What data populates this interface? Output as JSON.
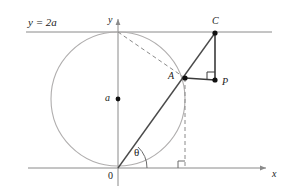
{
  "figure": {
    "width": 288,
    "height": 194,
    "background": "#ffffff"
  },
  "colors": {
    "axis": "#8a8a8a",
    "tangent_line": "#8a8a8a",
    "circle": "#b0aeae",
    "solid_ray": "#4a4a4a",
    "segment": "#3a3a3a",
    "dashed": "#8a8a8a",
    "point_fill": "#111111",
    "label_text": "#1b1b1b"
  },
  "labels": {
    "line_equation": "y = 2a",
    "y_axis": "y",
    "x_axis": "x",
    "origin": "0",
    "center": "a",
    "point_a": "A",
    "point_c": "C",
    "point_p": "P",
    "angle_theta": "θ"
  },
  "geometry": {
    "origin": {
      "x": 118,
      "y": 168
    },
    "circle": {
      "cx": 118,
      "cy": 99,
      "r": 67
    },
    "tangent_line_y": 32,
    "x_axis_y": 168,
    "y_axis_x": 118,
    "points": [
      {
        "name": "A",
        "x": 185,
        "y": 78
      },
      {
        "name": "C",
        "x": 215,
        "y": 33
      },
      {
        "name": "P",
        "x": 215,
        "y": 80
      },
      {
        "name": "center",
        "x": 118,
        "y": 99
      },
      {
        "name": "O",
        "x": 118,
        "y": 168
      }
    ],
    "dashed_segments": [
      {
        "from": "circle-top",
        "to": "A"
      },
      {
        "from": "A",
        "to": "x-axis-foot"
      }
    ],
    "right_angle_markers": [
      {
        "at": "P-corner",
        "x": 215,
        "y": 80
      },
      {
        "at": "x-axis-foot",
        "x": 185,
        "y": 168
      }
    ]
  },
  "label_positions": {
    "line_equation": {
      "left": 28,
      "top": 17
    },
    "y_axis": {
      "left": 108,
      "top": 15
    },
    "x_axis": {
      "left": 272,
      "top": 169
    },
    "origin": {
      "left": 108,
      "top": 171
    },
    "center": {
      "left": 105,
      "top": 93
    },
    "point_a": {
      "left": 168,
      "top": 71
    },
    "point_c": {
      "left": 212,
      "top": 16
    },
    "point_p": {
      "left": 222,
      "top": 77
    },
    "angle_theta": {
      "left": 134,
      "top": 147
    }
  }
}
